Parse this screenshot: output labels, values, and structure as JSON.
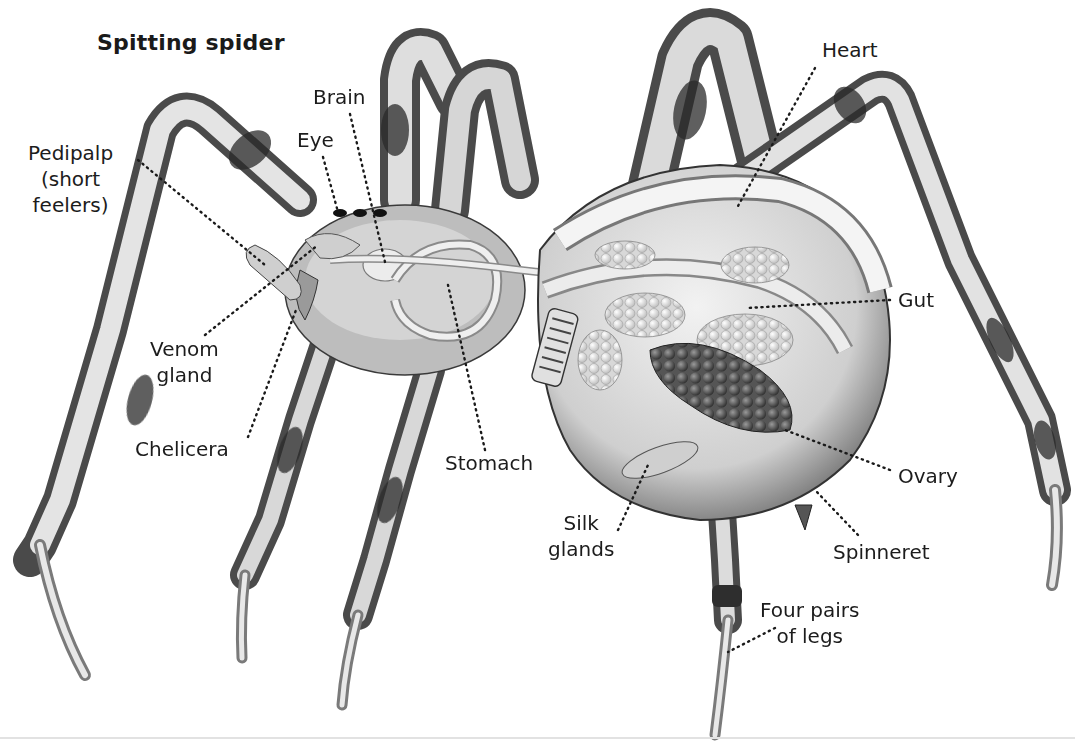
{
  "diagram": {
    "title": "Spitting spider",
    "colors": {
      "background": "#ffffff",
      "text": "#1c1c1c",
      "leader_line": "#1a1a1a",
      "leg_light": "#dcdcdc",
      "leg_dark": "#3a3a3a",
      "organ_light": "#e8e8e8",
      "ovary_dark": "#4a4a4a"
    },
    "labels": [
      {
        "id": "pedipalp",
        "lines": [
          "Pedipalp",
          "(short",
          "feelers)"
        ]
      },
      {
        "id": "eye",
        "lines": [
          "Eye"
        ]
      },
      {
        "id": "brain",
        "lines": [
          "Brain"
        ]
      },
      {
        "id": "heart",
        "lines": [
          "Heart"
        ]
      },
      {
        "id": "gut",
        "lines": [
          "Gut"
        ]
      },
      {
        "id": "venom-gland",
        "lines": [
          "Venom",
          "gland"
        ]
      },
      {
        "id": "chelicera",
        "lines": [
          "Chelicera"
        ]
      },
      {
        "id": "stomach",
        "lines": [
          "Stomach"
        ]
      },
      {
        "id": "ovary",
        "lines": [
          "Ovary"
        ]
      },
      {
        "id": "silk-glands",
        "lines": [
          "Silk",
          "glands"
        ]
      },
      {
        "id": "spinneret",
        "lines": [
          "Spinneret"
        ]
      },
      {
        "id": "legs",
        "lines": [
          "Four pairs",
          "of legs"
        ]
      }
    ]
  }
}
